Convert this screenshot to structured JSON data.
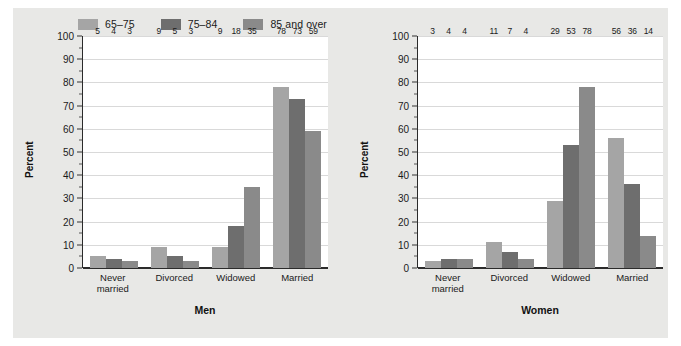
{
  "legend": {
    "items": [
      {
        "label": "65–75",
        "color": "#a5a5a5",
        "name": "legend-swatch-65-75"
      },
      {
        "label": "75–84",
        "color": "#6e6e6e",
        "name": "legend-swatch-75-84"
      },
      {
        "label": "85 and over",
        "color": "#8a8a8a",
        "name": "legend-swatch-85-and-over"
      }
    ]
  },
  "axis": {
    "ylabel": "Percent",
    "yticks": [
      "0",
      "10",
      "20",
      "30",
      "40",
      "50",
      "60",
      "70",
      "80",
      "90",
      "100"
    ]
  },
  "panels": [
    {
      "title": "Men"
    },
    {
      "title": "Women"
    }
  ],
  "categories": [
    {
      "line1": "Never",
      "line2": "married"
    },
    {
      "line1": "Divorced",
      "line2": ""
    },
    {
      "line1": "Widowed",
      "line2": ""
    },
    {
      "line1": "Married",
      "line2": ""
    }
  ],
  "chart_data": {
    "type": "bar",
    "title": "",
    "xlabel": "",
    "ylabel": "Percent",
    "ylim": [
      0,
      100
    ],
    "yticks": [
      0,
      10,
      20,
      30,
      40,
      50,
      60,
      70,
      80,
      90,
      100
    ],
    "grid": "horizontal",
    "legend_position": "top-left",
    "categories": [
      "Never married",
      "Divorced",
      "Widowed",
      "Married"
    ],
    "panels": [
      {
        "title": "Men",
        "series": [
          {
            "name": "65–75",
            "color": "#a5a5a5",
            "values": [
              5,
              9,
              9,
              78
            ]
          },
          {
            "name": "75–84",
            "color": "#6e6e6e",
            "values": [
              4,
              5,
              18,
              73
            ]
          },
          {
            "name": "85 and over",
            "color": "#8a8a8a",
            "values": [
              3,
              3,
              35,
              59
            ]
          }
        ]
      },
      {
        "title": "Women",
        "series": [
          {
            "name": "65–75",
            "color": "#a5a5a5",
            "values": [
              3,
              11,
              29,
              56
            ]
          },
          {
            "name": "75–84",
            "color": "#6e6e6e",
            "values": [
              4,
              7,
              53,
              36
            ]
          },
          {
            "name": "85 and over",
            "color": "#8a8a8a",
            "values": [
              4,
              4,
              78,
              14
            ]
          }
        ]
      }
    ]
  }
}
